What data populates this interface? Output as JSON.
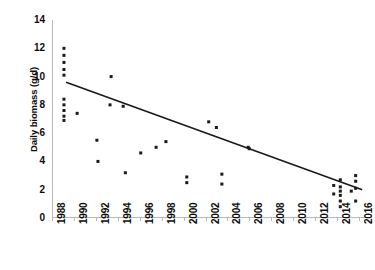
{
  "chart_data": {
    "type": "scatter",
    "title": "",
    "xlabel": "",
    "ylabel": "Daily biomass (g/d)",
    "xlim": [
      1988,
      2017
    ],
    "ylim": [
      0,
      14
    ],
    "xticks": [
      1988,
      1990,
      1992,
      1994,
      1996,
      1998,
      2000,
      2002,
      2004,
      2006,
      2008,
      2010,
      2012,
      2014,
      2016
    ],
    "yticks": [
      0,
      2,
      4,
      6,
      8,
      10,
      12,
      14
    ],
    "grid": false,
    "legend": "none",
    "marker_color": "#1a1a1a",
    "line_color": "#1a1a1a",
    "axis_color": "#b9b9b9",
    "background_color": "#ffffff",
    "points": [
      {
        "x": 1989.0,
        "y": 12.0
      },
      {
        "x": 1989.0,
        "y": 11.5
      },
      {
        "x": 1989.0,
        "y": 11.0
      },
      {
        "x": 1989.0,
        "y": 10.5
      },
      {
        "x": 1989.0,
        "y": 10.1
      },
      {
        "x": 1989.0,
        "y": 8.4
      },
      {
        "x": 1989.0,
        "y": 8.0
      },
      {
        "x": 1989.0,
        "y": 7.6
      },
      {
        "x": 1989.0,
        "y": 7.2
      },
      {
        "x": 1989.0,
        "y": 6.9
      },
      {
        "x": 1990.2,
        "y": 7.4
      },
      {
        "x": 1992.0,
        "y": 5.5
      },
      {
        "x": 1992.1,
        "y": 4.0
      },
      {
        "x": 1993.3,
        "y": 10.0
      },
      {
        "x": 1993.2,
        "y": 8.0
      },
      {
        "x": 1994.4,
        "y": 7.9
      },
      {
        "x": 1994.6,
        "y": 3.2
      },
      {
        "x": 1996.0,
        "y": 4.6
      },
      {
        "x": 1997.4,
        "y": 5.0
      },
      {
        "x": 1998.3,
        "y": 5.4
      },
      {
        "x": 2000.2,
        "y": 2.9
      },
      {
        "x": 2000.2,
        "y": 2.5
      },
      {
        "x": 2002.2,
        "y": 6.8
      },
      {
        "x": 2002.9,
        "y": 6.4
      },
      {
        "x": 2003.4,
        "y": 3.1
      },
      {
        "x": 2003.4,
        "y": 2.4
      },
      {
        "x": 2005.8,
        "y": 5.0
      },
      {
        "x": 2005.9,
        "y": 4.9
      },
      {
        "x": 2013.6,
        "y": 2.3
      },
      {
        "x": 2013.6,
        "y": 1.7
      },
      {
        "x": 2014.2,
        "y": 2.7
      },
      {
        "x": 2014.2,
        "y": 2.2
      },
      {
        "x": 2014.2,
        "y": 1.9
      },
      {
        "x": 2014.2,
        "y": 1.6
      },
      {
        "x": 2014.2,
        "y": 1.2
      },
      {
        "x": 2014.2,
        "y": 0.8
      },
      {
        "x": 2015.6,
        "y": 3.0
      },
      {
        "x": 2015.6,
        "y": 2.6
      },
      {
        "x": 2015.6,
        "y": 2.1
      },
      {
        "x": 2015.6,
        "y": 1.2
      },
      {
        "x": 2015.2,
        "y": 1.9
      }
    ],
    "trendline": {
      "x_start": 1989.2,
      "y_start": 9.6,
      "x_end": 2016.2,
      "y_end": 2.0
    }
  }
}
